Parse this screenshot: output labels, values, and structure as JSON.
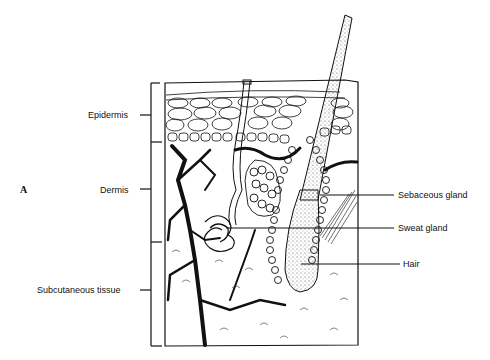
{
  "figure": {
    "panel_letter": "A"
  },
  "layers": [
    {
      "label": "Epidermis"
    },
    {
      "label": "Dermis"
    },
    {
      "label": "Subcutaneous tissue"
    }
  ],
  "structures": [
    {
      "label": "Sebaceous gland"
    },
    {
      "label": "Sweat gland"
    },
    {
      "label": "Hair"
    }
  ],
  "colors": {
    "ink": "#111111",
    "background": "#ffffff"
  }
}
